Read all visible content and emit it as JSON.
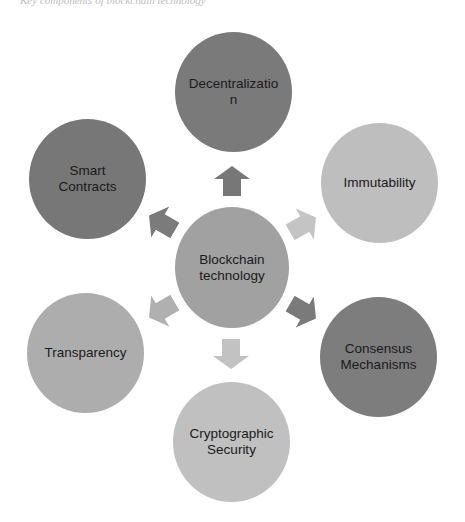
{
  "caption": "Key components of blockchain technology",
  "diagram": {
    "center": {
      "label": "Blockchain technology",
      "color": "#a1a1a1"
    },
    "nodes": [
      {
        "id": "decentralization",
        "label": "Decentralization",
        "color": "#7a7a7a"
      },
      {
        "id": "immutability",
        "label": "Immutability",
        "color": "#bebebe"
      },
      {
        "id": "consensus",
        "label": "Consensus Mechanisms",
        "color": "#7d7d7d"
      },
      {
        "id": "cryptographic",
        "label": "Cryptographic Security",
        "color": "#c0c0c0"
      },
      {
        "id": "transparency",
        "label": "Transparency",
        "color": "#adadad"
      },
      {
        "id": "smart-contracts",
        "label": "Smart Contracts",
        "color": "#777777"
      }
    ],
    "arrows": [
      {
        "to": "decentralization",
        "color": "#777777"
      },
      {
        "to": "immutability",
        "color": "#c4c4c4"
      },
      {
        "to": "consensus",
        "color": "#7a7a7a"
      },
      {
        "to": "cryptographic",
        "color": "#c2c2c2"
      },
      {
        "to": "transparency",
        "color": "#b0b0b0"
      },
      {
        "to": "smart-contracts",
        "color": "#7b7b7b"
      }
    ]
  }
}
